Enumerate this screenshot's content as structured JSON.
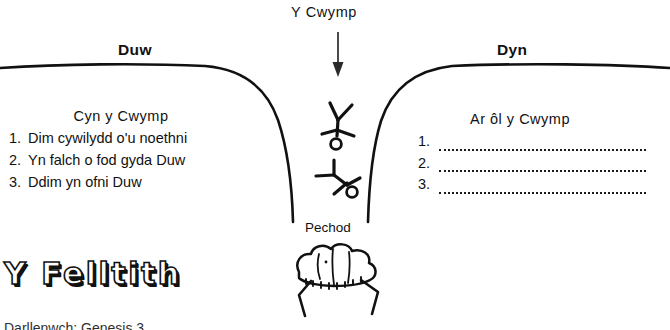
{
  "page": {
    "language": "Welsh",
    "background_color": "#ffffff",
    "ink_color": "#111111"
  },
  "diagram": {
    "title": "Y Cwymp",
    "left_header": "Duw",
    "right_header": "Dyn",
    "chasm_label": "Pechod",
    "arrow": "down-arrow"
  },
  "left_panel": {
    "title": "Cyn y Cwymp",
    "items": [
      {
        "number": "1.",
        "text": "Dim cywilydd o'u noethni"
      },
      {
        "number": "2.",
        "text": "Yn falch o fod gyda Duw"
      },
      {
        "number": "3.",
        "text": "Ddim yn ofni Duw"
      }
    ]
  },
  "right_panel": {
    "title": "Ar ôl y Cwymp",
    "items": [
      {
        "number": "1.",
        "text": ""
      },
      {
        "number": "2.",
        "text": ""
      },
      {
        "number": "3.",
        "text": ""
      }
    ]
  },
  "section_heading": {
    "text": "Y Felltith"
  },
  "cutoff_text": {
    "text": "Darllenwch: Genesis 3"
  },
  "figures": {
    "falling_figure_upper": "falling-stick-figure-icon",
    "falling_figure_lower": "tumbling-stick-figure-icon",
    "creature": "thorn-creature-icon"
  }
}
